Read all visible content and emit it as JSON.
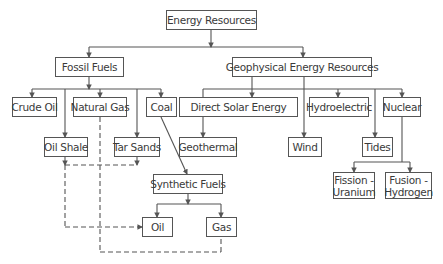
{
  "diagram": {
    "type": "hierarchy",
    "root": "Energy Resources",
    "nodes": {
      "energy_resources": "Energy Resources",
      "fossil_fuels": "Fossil Fuels",
      "geophysical": "Geophysical Energy Resources",
      "crude_oil": "Crude Oil",
      "natural_gas": "Natural Gas",
      "coal": "Coal",
      "oil_shale": "Oil Shale",
      "tar_sands": "Tar Sands",
      "synthetic_fuels": "Synthetic Fuels",
      "oil": "Oil",
      "gas": "Gas",
      "direct_solar": "Direct Solar Energy",
      "hydroelectric": "Hydroelectric",
      "nuclear": "Nuclear",
      "geothermal": "Geothermal",
      "wind": "Wind",
      "tides": "Tides",
      "fission_line1": "Fission -",
      "fission_line2": "Uranium",
      "fusion_line1": "Fusion -",
      "fusion_line2": "Hydrogen"
    },
    "edges": [
      {
        "from": "Energy Resources",
        "to": "Fossil Fuels",
        "style": "solid"
      },
      {
        "from": "Energy Resources",
        "to": "Geophysical Energy Resources",
        "style": "solid"
      },
      {
        "from": "Fossil Fuels",
        "to": "Crude Oil",
        "style": "solid"
      },
      {
        "from": "Fossil Fuels",
        "to": "Oil Shale",
        "style": "solid"
      },
      {
        "from": "Fossil Fuels",
        "to": "Natural Gas",
        "style": "solid"
      },
      {
        "from": "Fossil Fuels",
        "to": "Tar Sands",
        "style": "solid"
      },
      {
        "from": "Fossil Fuels",
        "to": "Coal",
        "style": "solid"
      },
      {
        "from": "Coal",
        "to": "Synthetic Fuels",
        "style": "solid"
      },
      {
        "from": "Synthetic Fuels",
        "to": "Oil",
        "style": "solid"
      },
      {
        "from": "Synthetic Fuels",
        "to": "Gas",
        "style": "solid"
      },
      {
        "from": "Oil Shale",
        "to": "Oil",
        "style": "dashed"
      },
      {
        "from": "Tar Sands",
        "to": "Oil",
        "style": "dashed"
      },
      {
        "from": "Natural Gas",
        "to": "Gas",
        "style": "dashed"
      },
      {
        "from": "Geophysical Energy Resources",
        "to": "Direct Solar Energy",
        "style": "solid"
      },
      {
        "from": "Geophysical Energy Resources",
        "to": "Geothermal",
        "style": "solid"
      },
      {
        "from": "Geophysical Energy Resources",
        "to": "Wind",
        "style": "solid"
      },
      {
        "from": "Geophysical Energy Resources",
        "to": "Hydroelectric",
        "style": "solid"
      },
      {
        "from": "Geophysical Energy Resources",
        "to": "Tides",
        "style": "solid"
      },
      {
        "from": "Geophysical Energy Resources",
        "to": "Nuclear",
        "style": "solid"
      },
      {
        "from": "Nuclear",
        "to": "Fission - Uranium",
        "style": "solid"
      },
      {
        "from": "Nuclear",
        "to": "Fusion - Hydrogen",
        "style": "solid"
      }
    ]
  },
  "colors": {
    "line": "#555555",
    "box_border": "#555555",
    "text": "#3a3a3a",
    "background": "#ffffff"
  }
}
